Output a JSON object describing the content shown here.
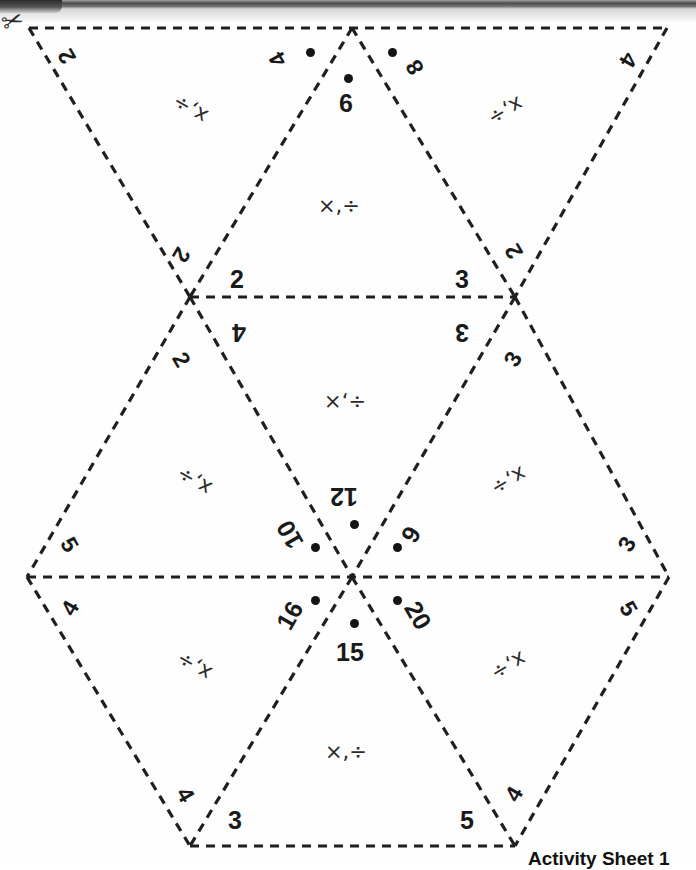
{
  "page": {
    "title": "Activity Sheet 1",
    "kind": "printable-math-net",
    "footer_label": "Activity Sheet 1",
    "cut_icon": "scissors-icon",
    "ink_color": "#1a1a1a",
    "line_color": "#222222",
    "paper_color": "#ffffff"
  },
  "net": {
    "description": "Hexagonal net of 12 dashed triangles forming a fold-up puzzle",
    "edge_style": "dashed",
    "triangles": [
      {
        "id": "t1",
        "row": "top",
        "orientation": "down",
        "ops": "x,÷",
        "rotation": 180,
        "corner_labels": [
          "2",
          "4",
          "2"
        ]
      },
      {
        "id": "t2",
        "row": "top",
        "orientation": "up",
        "ops": "×,÷",
        "rotation": 0,
        "corner_labels": [
          "6",
          "2",
          "3"
        ]
      },
      {
        "id": "t3",
        "row": "top",
        "orientation": "down",
        "ops": "x,÷",
        "rotation": 180,
        "corner_labels": [
          "8",
          "4",
          "2"
        ]
      },
      {
        "id": "t4",
        "row": "middle",
        "orientation": "up",
        "ops": "x,÷",
        "rotation": 180,
        "corner_labels": [
          "2",
          "5",
          "10"
        ]
      },
      {
        "id": "t5",
        "row": "middle",
        "orientation": "down",
        "ops": "÷,×",
        "rotation": 180,
        "corner_labels": [
          "4",
          "3",
          "12"
        ]
      },
      {
        "id": "t6",
        "row": "middle",
        "orientation": "up",
        "ops": "x,÷",
        "rotation": 180,
        "corner_labels": [
          "3",
          "6",
          "3"
        ]
      },
      {
        "id": "t7",
        "row": "bottom",
        "orientation": "down",
        "ops": "x,÷",
        "rotation": 180,
        "corner_labels": [
          "4",
          "16",
          "4"
        ]
      },
      {
        "id": "t8",
        "row": "bottom",
        "orientation": "up",
        "ops": "×,÷",
        "rotation": 0,
        "corner_labels": [
          "15",
          "3",
          "5"
        ]
      },
      {
        "id": "t9",
        "row": "bottom",
        "orientation": "down",
        "ops": "x,÷",
        "rotation": 180,
        "corner_labels": [
          "20",
          "5",
          "4"
        ]
      }
    ]
  },
  "hub": {
    "name": "center-hub",
    "items": [
      {
        "value": "12",
        "dot": true,
        "position": "top"
      },
      {
        "value": "10",
        "dot": true,
        "position": "upper-left"
      },
      {
        "value": "6",
        "dot": true,
        "position": "upper-right"
      },
      {
        "value": "16",
        "dot": true,
        "position": "lower-left"
      },
      {
        "value": "20",
        "dot": true,
        "position": "lower-right"
      },
      {
        "value": "15",
        "dot": true,
        "position": "bottom"
      }
    ]
  },
  "vertex_numbers": {
    "top_row": [
      {
        "text": "2",
        "at": "top-left-slope"
      },
      {
        "text": "4",
        "at": "top-center-left",
        "dot": true
      },
      {
        "text": "6",
        "at": "apex-2-center",
        "dot": true
      },
      {
        "text": "8",
        "at": "top-center-right",
        "dot": true
      },
      {
        "text": "4",
        "at": "top-right-slope"
      }
    ],
    "mid_upper_row": [
      {
        "text": "2",
        "at": "left-node-above-left"
      },
      {
        "text": "2",
        "at": "left-node-above-right"
      },
      {
        "text": "3",
        "at": "right-node-above-left"
      },
      {
        "text": "2",
        "at": "right-node-above-right"
      }
    ],
    "mid_lower_row": [
      {
        "text": "4",
        "at": "left-node-below-right"
      },
      {
        "text": "2",
        "at": "left-node-below-left"
      },
      {
        "text": "3",
        "at": "right-node-below-left"
      },
      {
        "text": "3",
        "at": "right-node-below-right"
      }
    ],
    "side_row": [
      {
        "text": "5",
        "at": "far-left-above"
      },
      {
        "text": "4",
        "at": "far-left-below"
      },
      {
        "text": "3",
        "at": "far-right-above"
      },
      {
        "text": "5",
        "at": "far-right-below"
      }
    ],
    "bottom_row": [
      {
        "text": "4",
        "at": "bottom-left-slope"
      },
      {
        "text": "3",
        "at": "bottom-center-left"
      },
      {
        "text": "5",
        "at": "bottom-center-right"
      },
      {
        "text": "4",
        "at": "bottom-right-slope"
      }
    ]
  },
  "operations": {
    "symbols": [
      "×",
      "÷"
    ],
    "separator": ","
  }
}
